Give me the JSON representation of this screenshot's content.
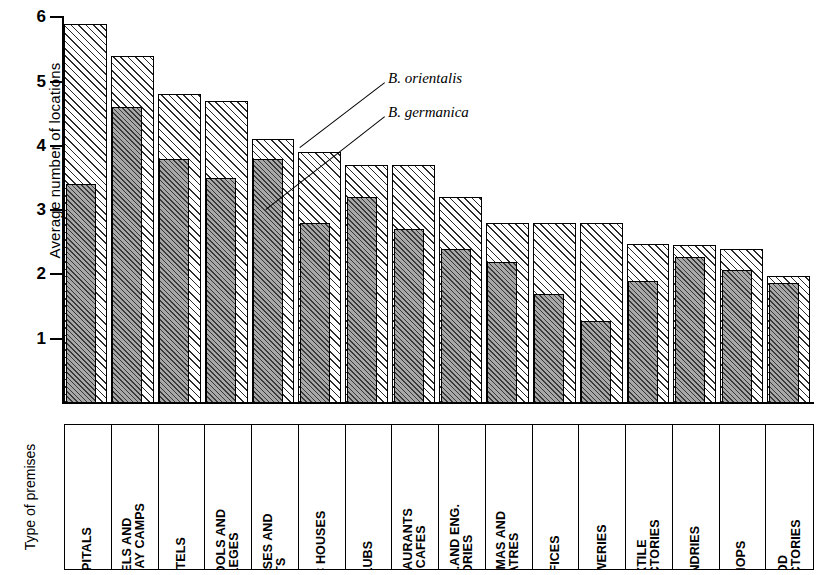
{
  "chart_data": {
    "type": "bar",
    "title": "",
    "subtitle": "",
    "xlabel": "Type of premises",
    "ylabel": "Average number of locations",
    "ylim": [
      0,
      6
    ],
    "yticks": [
      1,
      2,
      3,
      4,
      5,
      6
    ],
    "grid": false,
    "legend_position": "inline-annotation",
    "bar_style": "overlaid (B. germanica drawn in front of B. orientalis)",
    "categories": [
      "HOSPITALS",
      "HOSTELS AND HOLIDAY CAMPS",
      "HOTELS",
      "SCHOOLS AND COLLEGES",
      "HOUSES AND FLATS",
      "PUBLIC HOUSES",
      "CLUBS",
      "RESTAURANTS AND CAFES",
      "CHEM. AND ENG. FACTORIES",
      "CINEMAS AND THEATRES",
      "OFFICES",
      "BREWERIES",
      "TEXTILE FACTORIES",
      "LAUNDRIES",
      "SHOPS",
      "FOOD FACTORIES"
    ],
    "series": [
      {
        "name": "B. orientalis",
        "values": [
          5.9,
          5.4,
          4.8,
          4.7,
          4.1,
          3.9,
          3.7,
          3.7,
          3.2,
          2.8,
          2.8,
          2.8,
          2.47,
          2.45,
          2.4,
          1.97
        ]
      },
      {
        "name": "B. germanica",
        "values": [
          3.4,
          4.6,
          3.8,
          3.5,
          3.8,
          2.8,
          3.2,
          2.7,
          2.4,
          2.2,
          1.7,
          1.27,
          1.9,
          2.27,
          2.07,
          1.87
        ]
      }
    ],
    "annotations": [
      {
        "text": "B. orientalis",
        "points_to": "outer light hatched bar"
      },
      {
        "text": "B. germanica",
        "points_to": "inner grey hatched bar"
      }
    ],
    "colors": {
      "orientalis_fill": "#ffffff",
      "germanica_fill": "#a8a8a8",
      "hatch": "#2b2b2b",
      "outline": "#000000"
    }
  },
  "axis": {
    "y_label": "Average number of locations",
    "tick_labels": [
      "1",
      "2",
      "3",
      "4",
      "5",
      "6"
    ]
  },
  "category_table": {
    "header": "Type of premises",
    "cells": [
      "HOSPITALS",
      "HOSTELS AND\nHOLIDAY CAMPS",
      "HOTELS",
      "SCHOOLS AND\nCOLLEGES",
      "HOUSES AND\nFLATS",
      "PUBLIC HOUSES",
      "CLUBS",
      "RESTAURANTS\nAND  CAFES",
      "CHEM.AND ENG.\nFACTORIES",
      "CINEMAS AND\nTHEATRES",
      "OFFICES",
      "BREWERIES",
      "TEXTILE\nFACTORIES",
      "LAUNDRIES",
      "SHOPS",
      "FOOD\nFACTORIES"
    ]
  },
  "legend": {
    "orientalis": "B. orientalis",
    "germanica": "B. germanica"
  }
}
